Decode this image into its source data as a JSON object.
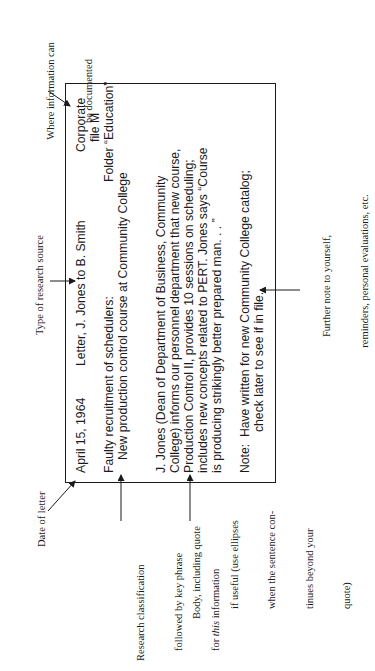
{
  "card": {
    "date": "April 15, 1964",
    "source_type": "Letter, J. Jones to B. Smith",
    "location_line1": "Corporate",
    "location_line2": "file M",
    "location_line3": "Folder “Education”",
    "classification": "Faulty recruitment of schedulers:",
    "key_phrase": "New production control course at Community College",
    "body_lines": [
      "J. Jones (Dean of Department of Business, Community",
      "College) informs our personnel department that new course,",
      "Production Control II, provides 10 sessions on scheduling;",
      "includes new concepts related to PERT. Jones says “Course",
      "is producing strikingly better prepared man. . . ”"
    ],
    "note_line1": "Note:  Have written for new Community College catalog;",
    "note_line2": "check later to see if in file."
  },
  "annotations": {
    "where_documented": [
      "Where information can",
      "be documented"
    ],
    "type_of_source": "Type of research source",
    "date_of_letter": "Date of letter",
    "classification": [
      "Research classification",
      "followed by key phrase",
      "for this information"
    ],
    "classification_italic_word": "this",
    "body": [
      "Body, including quote",
      "if useful (use ellipses",
      "when the sentence con-",
      "tinues beyond your",
      "quote)"
    ],
    "further_note": [
      "Further note to yourself,",
      "reminders, personal evaluations, etc."
    ]
  }
}
